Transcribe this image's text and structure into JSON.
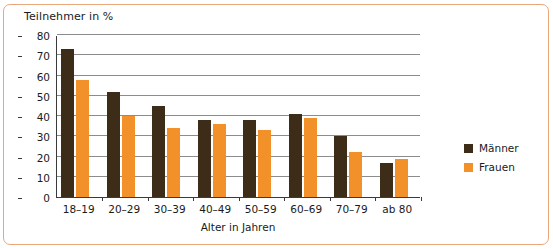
{
  "chart_data": {
    "type": "bar",
    "title": "Teilnehmer in %",
    "xlabel": "Alter in Jahren",
    "ylabel": "Teilnehmer in %",
    "categories": [
      "18–19",
      "20–29",
      "30–39",
      "40–49",
      "50–59",
      "60–69",
      "70–79",
      "ab 80"
    ],
    "series": [
      {
        "name": "Männer",
        "color": "#3c2c18",
        "values": [
          73,
          52,
          45,
          38,
          38,
          41,
          30,
          17
        ]
      },
      {
        "name": "Frauen",
        "color": "#f2912a",
        "values": [
          58,
          40,
          34,
          36,
          33,
          39,
          22,
          19
        ]
      }
    ],
    "ylim": [
      0,
      80
    ],
    "ytick_labels": [
      "0",
      "10",
      "20",
      "30",
      "40",
      "50",
      "60",
      "70",
      "80"
    ],
    "ytick_values": [
      0,
      10,
      20,
      30,
      40,
      50,
      60,
      70,
      80
    ],
    "grid": true,
    "legend_position": "right",
    "frame_color": "#e8a87c",
    "axis_color": "#3a3a3a",
    "grid_color": "#8c8c8c"
  }
}
